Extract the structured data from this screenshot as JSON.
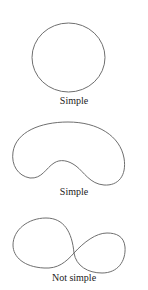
{
  "figures": [
    {
      "shape": "circle",
      "label": "Simple"
    },
    {
      "shape": "kidney",
      "label": "Simple"
    },
    {
      "shape": "figure-eight",
      "label": "Not simple"
    }
  ],
  "colors": {
    "stroke": "#6f6f6f",
    "text": "#222222",
    "background": "#ffffff"
  }
}
